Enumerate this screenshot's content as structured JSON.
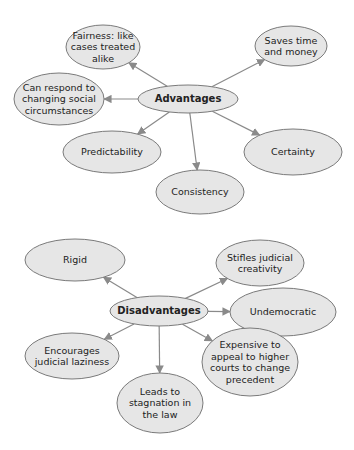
{
  "colors": {
    "ellipse_fill": "#e6e6e6",
    "ellipse_stroke": "#7a7a7a",
    "arrow": "#8a8a8a",
    "text": "#222222"
  },
  "diagrams": [
    {
      "hub": {
        "label": "Advantages",
        "cx": 188,
        "cy": 99,
        "rx": 50,
        "ry": 14
      },
      "nodes": [
        {
          "label": "Fairness: like\ncases treated\nalike",
          "cx": 103,
          "cy": 47,
          "rx": 37,
          "ry": 22
        },
        {
          "label": "Saves time\nand money",
          "cx": 291,
          "cy": 46,
          "rx": 36,
          "ry": 20
        },
        {
          "label": "Can respond to\nchanging social\ncircumstances",
          "cx": 59,
          "cy": 99,
          "rx": 45,
          "ry": 26
        },
        {
          "label": "Predictability",
          "cx": 112,
          "cy": 152,
          "rx": 49,
          "ry": 21
        },
        {
          "label": "Certainty",
          "cx": 293,
          "cy": 152,
          "rx": 49,
          "ry": 23
        },
        {
          "label": "Consistency",
          "cx": 200,
          "cy": 192,
          "rx": 44,
          "ry": 22
        }
      ]
    },
    {
      "hub": {
        "label": "Disadvantages",
        "cx": 159,
        "cy": 311,
        "rx": 49,
        "ry": 15
      },
      "nodes": [
        {
          "label": "Rigid",
          "cx": 75,
          "cy": 260,
          "rx": 50,
          "ry": 21
        },
        {
          "label": "Stifles judicial\ncreativity",
          "cx": 260,
          "cy": 263,
          "rx": 44,
          "ry": 23
        },
        {
          "label": "Undemocratic",
          "cx": 283,
          "cy": 312,
          "rx": 53,
          "ry": 24
        },
        {
          "label": "Encourages\njudicial laziness",
          "cx": 72,
          "cy": 356,
          "rx": 47,
          "ry": 23
        },
        {
          "label": "Expensive to\nappeal to higher\ncourts to change\nprecedent",
          "cx": 250,
          "cy": 362,
          "rx": 48,
          "ry": 34
        },
        {
          "label": "Leads to\nstagnation in\nthe law",
          "cx": 160,
          "cy": 403,
          "rx": 43,
          "ry": 30
        }
      ]
    }
  ]
}
